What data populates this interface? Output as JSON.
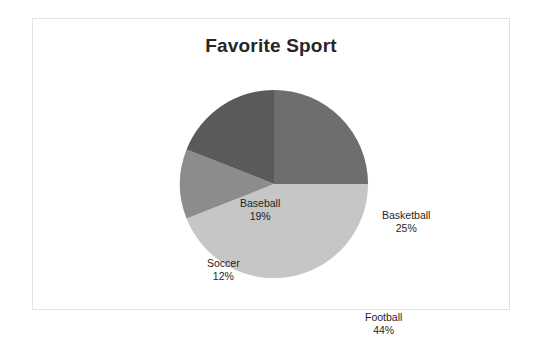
{
  "chart_data": {
    "type": "pie",
    "title": "Favorite Sport",
    "xlabel": "",
    "ylabel": "",
    "categories": [
      "Basketball",
      "Football",
      "Soccer",
      "Baseball"
    ],
    "values": [
      25,
      44,
      12,
      19
    ],
    "value_suffix": "%",
    "start_angle_deg": 0,
    "direction": "clockwise",
    "legend": "none",
    "grid": false,
    "labels_inside": true,
    "slices": [
      {
        "label": "Basketball",
        "value": 25,
        "display_value": "25%",
        "color": "#6e6e6e"
      },
      {
        "label": "Football",
        "value": 44,
        "display_value": "44%",
        "color": "#c6c6c6"
      },
      {
        "label": "Soccer",
        "value": 12,
        "display_value": "12%",
        "color": "#8c8c8c"
      },
      {
        "label": "Baseball",
        "value": 19,
        "display_value": "19%",
        "color": "#5a5a5a"
      }
    ]
  },
  "frame": {
    "border_color": "#e2e2e2",
    "background": "#ffffff"
  }
}
